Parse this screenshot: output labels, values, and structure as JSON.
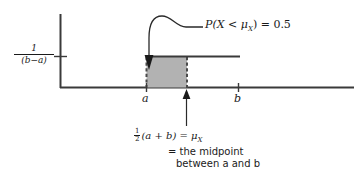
{
  "figure": {
    "kind": "uniform-distribution-diagram",
    "colors": {
      "ink": "#1a1a1a",
      "shade_fill": "#b2b2b2",
      "shade_border": "#4d4d4d",
      "background": "#ffffff"
    },
    "axes": {
      "y_tick_label": {
        "numerator": "1",
        "denominator": "(b−a)"
      },
      "x_tick_labels": [
        {
          "name": "a",
          "text": "a",
          "x": 146
        },
        {
          "name": "b",
          "text": "b",
          "x": 238
        }
      ]
    },
    "annotations": {
      "probability": "P(X < μ",
      "probability_sub": "X",
      "probability_tail": ") = 0.5",
      "probability_full": "P(X < μX) = 0.5"
    },
    "caption": {
      "fraction_num": "1",
      "fraction_den": "2",
      "line1_body": "(a + b) = μ",
      "line1_sub": "X",
      "line2": "= the midpoint",
      "line3": "between a and b"
    },
    "region": {
      "label": "shaded-probability-region",
      "from": "a",
      "to": "μX"
    }
  }
}
